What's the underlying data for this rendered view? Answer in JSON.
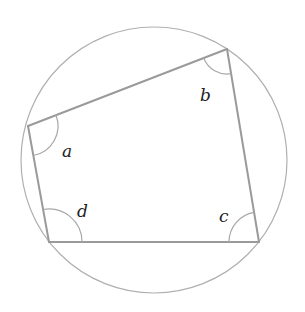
{
  "diagram": {
    "type": "cyclic-quadrilateral",
    "circle": {
      "cx": 154,
      "cy": 160,
      "r": 133
    },
    "vertices": {
      "A": {
        "x": 28,
        "y": 126
      },
      "B": {
        "x": 227,
        "y": 49
      },
      "C": {
        "x": 259,
        "y": 242
      },
      "D": {
        "x": 49,
        "y": 242
      }
    },
    "angles": [
      {
        "vertex": "A",
        "label": "a",
        "label_x": 62,
        "label_y": 157
      },
      {
        "vertex": "B",
        "label": "b",
        "label_x": 200,
        "label_y": 101
      },
      {
        "vertex": "C",
        "label": "c",
        "label_x": 219,
        "label_y": 222
      },
      {
        "vertex": "D",
        "label": "d",
        "label_x": 77,
        "label_y": 217
      }
    ],
    "colors": {
      "circle": "#b0b0b0",
      "sides": "#9a9a9a",
      "arcs": "#a8a8a8",
      "labels": "#222222"
    }
  }
}
